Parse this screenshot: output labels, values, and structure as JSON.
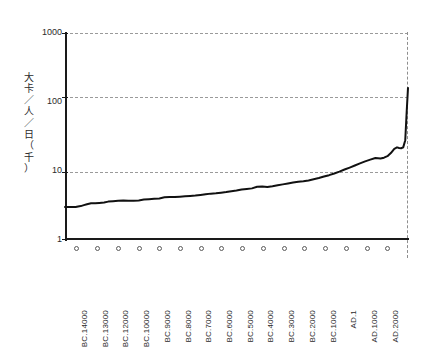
{
  "chart_data": {
    "type": "line",
    "title": "",
    "xlabel": "",
    "ylabel": "大卡／人／日（千）",
    "ylabel_chars": [
      "大",
      "卡",
      "／",
      "人",
      "／",
      "日",
      "（",
      "千",
      "）"
    ],
    "yscale": "log",
    "ylim": [
      1,
      1000
    ],
    "yticks": [
      1,
      10,
      100,
      1000
    ],
    "ytick_labels": [
      "1",
      "10",
      "100",
      "1000"
    ],
    "grid": "horizontal-dashed",
    "legend": "none",
    "categories": [
      "BC.14000",
      "BC.13000",
      "BC.12000",
      "BC.10000",
      "BC.9000",
      "BC.8000",
      "BC.7000",
      "BC.6000",
      "BC.5000",
      "BC.4000",
      "BC.3000",
      "BC.2000",
      "BC.1000",
      "AD.1",
      "AD.1000",
      "AD.2000"
    ],
    "series": [
      {
        "name": "energy-per-capita",
        "x": [
          0.0,
          1.2,
          2.4,
          3.1,
          3.8,
          4.6,
          5.5,
          6.4,
          7.6,
          8.8,
          10.0,
          11.4,
          12.6,
          14.0,
          15.5,
          17.0,
          18.5,
          20.0,
          21.5,
          23.0,
          24.5,
          26.0,
          27.5,
          29.0,
          30.5,
          32.0,
          33.5,
          35.0,
          36.5,
          38.0,
          39.5,
          41.0,
          42.5,
          44.0,
          45.5,
          47.0,
          48.5,
          50.0,
          51.5,
          53.0,
          54.5,
          56.0,
          57.5,
          59.0,
          60.5,
          62.0,
          63.5,
          65.0,
          66.5,
          68.0,
          69.5,
          71.0,
          72.5,
          74.0,
          75.5,
          77.0,
          78.5,
          80.0,
          81.5,
          83.0,
          84.5,
          86.0,
          87.5,
          89.0,
          90.5,
          92.0,
          93.0,
          94.0,
          95.0,
          96.0,
          96.8,
          97.4,
          98.0,
          98.6,
          99.2,
          99.6,
          100.0
        ],
        "values": [
          3.0,
          3.0,
          3.0,
          3.0,
          3.05,
          3.1,
          3.2,
          3.3,
          3.4,
          3.4,
          3.45,
          3.5,
          3.6,
          3.65,
          3.7,
          3.75,
          3.7,
          3.7,
          3.75,
          3.85,
          3.9,
          3.95,
          4.0,
          4.15,
          4.2,
          4.2,
          4.25,
          4.3,
          4.35,
          4.4,
          4.5,
          4.6,
          4.7,
          4.75,
          4.85,
          4.95,
          5.1,
          5.2,
          5.4,
          5.5,
          5.6,
          5.9,
          5.95,
          5.85,
          6.0,
          6.2,
          6.4,
          6.6,
          6.8,
          7.0,
          7.1,
          7.3,
          7.6,
          7.9,
          8.3,
          8.7,
          9.2,
          9.8,
          10.5,
          11.2,
          12.0,
          12.9,
          13.8,
          14.6,
          15.4,
          15.2,
          15.6,
          16.4,
          18.2,
          21.0,
          22.0,
          21.6,
          21.4,
          22.0,
          28.0,
          70.0,
          160.0
        ]
      }
    ]
  }
}
